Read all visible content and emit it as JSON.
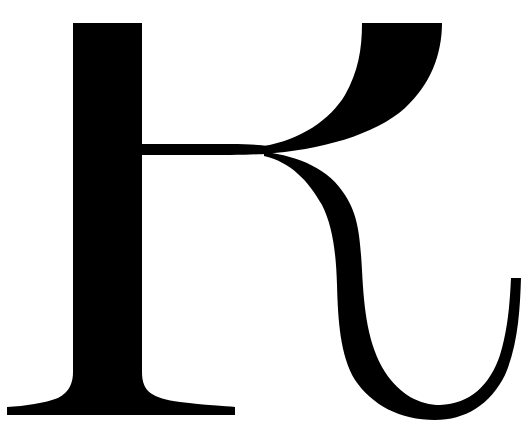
{
  "glyph": {
    "character": "K",
    "description": "Large black serif letterform K with a curling tail on a white background",
    "fill_color": "#000000",
    "background_color": "#ffffff"
  }
}
